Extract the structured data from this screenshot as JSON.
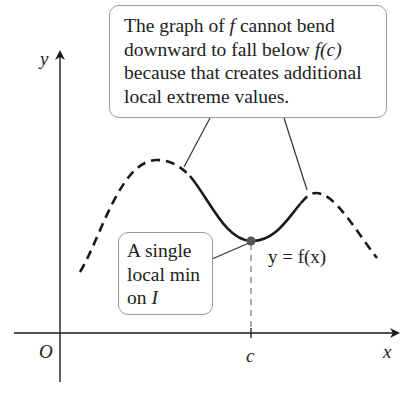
{
  "diagram": {
    "type": "function-graph-annotation",
    "axes": {
      "x_label": "x",
      "y_label": "y",
      "origin_label": "O",
      "tick_label": "c"
    },
    "curve_label": "y = f(x)",
    "callouts": {
      "main": {
        "lines": [
          {
            "pre": "The graph of ",
            "it": "f",
            "post": " cannot bend"
          },
          {
            "pre": "downward to fall below ",
            "it": "f(c)",
            "post": ""
          },
          {
            "pre": "because that creates additional",
            "it": "",
            "post": ""
          },
          {
            "pre": "local extreme values.",
            "it": "",
            "post": ""
          }
        ]
      },
      "min": {
        "lines": [
          {
            "pre": "A single",
            "it": "",
            "post": ""
          },
          {
            "pre": "local min",
            "it": "",
            "post": ""
          },
          {
            "pre": "on ",
            "it": "I",
            "post": ""
          }
        ]
      }
    },
    "colors": {
      "stroke": "#1a1a1a",
      "box_border": "#9a9a9a",
      "point": "#555555",
      "guide": "#777777"
    }
  }
}
